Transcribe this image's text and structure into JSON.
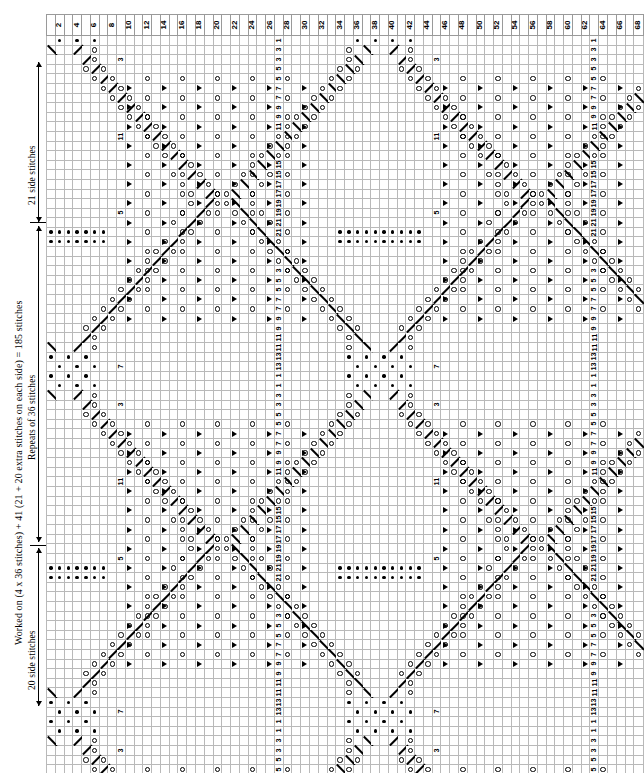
{
  "chart_data": {
    "type": "table",
    "grid": {
      "columns": 68,
      "rows": 78
    },
    "column_numbers_top": [
      2,
      4,
      6,
      8,
      10,
      12,
      14,
      16,
      18,
      20,
      22,
      24,
      26,
      28,
      30,
      32,
      34,
      36,
      38,
      40,
      42,
      44,
      46,
      48,
      50,
      52,
      54,
      56,
      58,
      60,
      62,
      64,
      66,
      68
    ],
    "column_numbers_bottom": [
      1,
      3,
      5,
      7,
      9,
      11,
      13,
      15,
      17,
      19,
      21,
      23,
      25,
      27,
      29,
      31,
      33,
      35,
      37,
      39,
      41,
      43,
      45,
      47,
      49,
      51,
      53,
      55,
      57,
      59,
      61,
      63,
      65,
      67
    ],
    "row_numbers_in_chart": [
      1,
      3,
      5,
      7,
      9,
      11,
      13,
      15,
      17,
      19,
      21
    ],
    "repeat_boundaries_after_columns": [
      21,
      39,
      57
    ],
    "section_divider_rows": [
      21,
      57
    ],
    "legend_symbols": [
      {
        "name": "yarn-over",
        "glyph": "open circle"
      },
      {
        "name": "purl",
        "glyph": "solid dot"
      },
      {
        "name": "decrease-right",
        "glyph": "solid right triangle"
      },
      {
        "name": "k2tog",
        "glyph": "diagonal stroke leaning right"
      },
      {
        "name": "ssk",
        "glyph": "diagonal stroke leaning left"
      }
    ],
    "xlabel": "",
    "ylabel": ""
  },
  "annotations": {
    "top_side": "21 side stitches",
    "middle": "Repeats of 36 stitches",
    "bottom_side": "20 side stitches",
    "formula": "Worked on (4 x 36 stitches) + 41 (21 + 20 extra stitches on each side) = 185 stitches"
  }
}
